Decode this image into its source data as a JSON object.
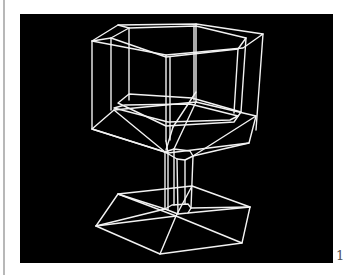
{
  "figure": {
    "background": "#000000",
    "line_color": "#f2f2f2",
    "line_width": 1.4,
    "page_number": "1",
    "polylines": [
      {
        "name": "rim-outer",
        "closed": true,
        "points": [
          [
            92,
            41
          ],
          [
            118,
            25
          ],
          [
            196,
            24
          ],
          [
            263,
            34
          ],
          [
            243,
            48
          ],
          [
            166,
            55
          ]
        ]
      },
      {
        "name": "rim-inner",
        "closed": true,
        "points": [
          [
            111,
            38
          ],
          [
            129,
            28
          ],
          [
            196,
            26
          ],
          [
            246,
            38
          ],
          [
            238,
            49
          ],
          [
            166,
            57
          ]
        ]
      },
      {
        "name": "rim-inner-link-a",
        "closed": false,
        "points": [
          [
            92,
            41
          ],
          [
            111,
            38
          ]
        ]
      },
      {
        "name": "rim-inner-link-b",
        "closed": false,
        "points": [
          [
            118,
            25
          ],
          [
            129,
            28
          ]
        ]
      },
      {
        "name": "wall-left-outer",
        "closed": false,
        "points": [
          [
            92,
            41
          ],
          [
            92,
            129
          ]
        ]
      },
      {
        "name": "wall-left-inner",
        "closed": false,
        "points": [
          [
            111,
            38
          ],
          [
            111,
            110
          ]
        ]
      },
      {
        "name": "wall-back-left",
        "closed": false,
        "points": [
          [
            129,
            28
          ],
          [
            129,
            100
          ]
        ]
      },
      {
        "name": "wall-back",
        "closed": false,
        "points": [
          [
            196,
            24
          ],
          [
            196,
            102
          ]
        ]
      },
      {
        "name": "wall-back-inner",
        "closed": false,
        "points": [
          [
            194,
            26
          ],
          [
            194,
            100
          ]
        ]
      },
      {
        "name": "wall-front-outer",
        "closed": false,
        "points": [
          [
            166,
            55
          ],
          [
            166,
            141
          ]
        ]
      },
      {
        "name": "wall-front-inner",
        "closed": false,
        "points": [
          [
            170,
            57
          ],
          [
            170,
            140
          ]
        ]
      },
      {
        "name": "wall-right-inner",
        "closed": false,
        "points": [
          [
            246,
            38
          ],
          [
            241,
            112
          ]
        ]
      },
      {
        "name": "wall-right-inner2",
        "closed": false,
        "points": [
          [
            238,
            49
          ],
          [
            234,
            113
          ]
        ]
      },
      {
        "name": "wall-right-outer",
        "closed": false,
        "points": [
          [
            263,
            34
          ],
          [
            256,
            130
          ]
        ]
      },
      {
        "name": "cup-floor-inner",
        "closed": true,
        "points": [
          [
            118,
            103
          ],
          [
            129,
            94
          ],
          [
            192,
            98
          ],
          [
            241,
            112
          ],
          [
            234,
            122
          ],
          [
            166,
            126
          ]
        ]
      },
      {
        "name": "cup-floor-inner2",
        "closed": true,
        "points": [
          [
            114,
            108
          ],
          [
            125,
            105
          ],
          [
            190,
            104
          ],
          [
            238,
            116
          ],
          [
            230,
            120
          ],
          [
            168,
            122
          ]
        ]
      },
      {
        "name": "bowl-bottom-outer",
        "closed": true,
        "points": [
          [
            92,
            129
          ],
          [
            114,
            110
          ],
          [
            196,
            102
          ],
          [
            256,
            116
          ],
          [
            249,
            143
          ],
          [
            168,
            153
          ]
        ]
      },
      {
        "name": "bowl-taper-1",
        "closed": false,
        "points": [
          [
            92,
            129
          ],
          [
            165,
            152
          ]
        ]
      },
      {
        "name": "bowl-taper-2",
        "closed": false,
        "points": [
          [
            114,
            110
          ],
          [
            165,
            152
          ]
        ]
      },
      {
        "name": "bowl-taper-3",
        "closed": false,
        "points": [
          [
            196,
            102
          ],
          [
            174,
            149
          ]
        ]
      },
      {
        "name": "bowl-taper-4",
        "closed": false,
        "points": [
          [
            256,
            116
          ],
          [
            193,
            156
          ]
        ]
      },
      {
        "name": "bowl-taper-5",
        "closed": false,
        "points": [
          [
            249,
            143
          ],
          [
            193,
            156
          ]
        ]
      },
      {
        "name": "bowl-taper-6",
        "closed": false,
        "points": [
          [
            166,
            141
          ],
          [
            168,
            153
          ]
        ]
      },
      {
        "name": "bowl-diagonal",
        "closed": false,
        "points": [
          [
            196,
            92
          ],
          [
            173,
            127
          ]
        ]
      },
      {
        "name": "bowl-diagonal-2",
        "closed": false,
        "points": [
          [
            173,
            127
          ],
          [
            166,
            150
          ]
        ]
      },
      {
        "name": "stem-top",
        "closed": true,
        "points": [
          [
            165,
            152
          ],
          [
            174,
            149
          ],
          [
            190,
            151
          ],
          [
            193,
            156
          ],
          [
            185,
            160
          ],
          [
            177,
            159
          ]
        ]
      },
      {
        "name": "stem-bottom",
        "closed": true,
        "points": [
          [
            165,
            209
          ],
          [
            172,
            205
          ],
          [
            188,
            204
          ],
          [
            191,
            208
          ],
          [
            188,
            213
          ],
          [
            178,
            214
          ]
        ]
      },
      {
        "name": "stem-edge-1",
        "closed": false,
        "points": [
          [
            165,
            152
          ],
          [
            165,
            209
          ]
        ]
      },
      {
        "name": "stem-edge-2",
        "closed": false,
        "points": [
          [
            168,
            153
          ],
          [
            168,
            210
          ]
        ]
      },
      {
        "name": "stem-edge-3",
        "closed": false,
        "points": [
          [
            174,
            149
          ],
          [
            174,
            205
          ]
        ]
      },
      {
        "name": "stem-edge-4",
        "closed": false,
        "points": [
          [
            177,
            159
          ],
          [
            178,
            214
          ]
        ]
      },
      {
        "name": "stem-edge-5",
        "closed": false,
        "points": [
          [
            185,
            160
          ],
          [
            185,
            204
          ]
        ]
      },
      {
        "name": "stem-edge-6",
        "closed": false,
        "points": [
          [
            193,
            156
          ],
          [
            191,
            208
          ]
        ]
      },
      {
        "name": "base-outer",
        "closed": true,
        "points": [
          [
            96,
            226
          ],
          [
            118,
            194
          ],
          [
            192,
            186
          ],
          [
            250,
            207
          ],
          [
            242,
            243
          ],
          [
            160,
            254
          ]
        ]
      },
      {
        "name": "base-spoke-1",
        "closed": false,
        "points": [
          [
            96,
            226
          ],
          [
            165,
            209
          ]
        ]
      },
      {
        "name": "base-spoke-2",
        "closed": false,
        "points": [
          [
            118,
            194
          ],
          [
            176,
            216
          ]
        ]
      },
      {
        "name": "base-spoke-3",
        "closed": false,
        "points": [
          [
            192,
            186
          ],
          [
            176,
            216
          ]
        ]
      },
      {
        "name": "base-spoke-4",
        "closed": false,
        "points": [
          [
            250,
            207
          ],
          [
            188,
            213
          ]
        ]
      },
      {
        "name": "base-spoke-5",
        "closed": false,
        "points": [
          [
            242,
            243
          ],
          [
            176,
            216
          ]
        ]
      },
      {
        "name": "base-spoke-6",
        "closed": false,
        "points": [
          [
            160,
            254
          ],
          [
            176,
            216
          ]
        ]
      },
      {
        "name": "base-spoke-7",
        "closed": false,
        "points": [
          [
            96,
            226
          ],
          [
            176,
            216
          ]
        ]
      },
      {
        "name": "base-spoke-8",
        "closed": false,
        "points": [
          [
            118,
            194
          ],
          [
            165,
            209
          ]
        ]
      },
      {
        "name": "base-spoke-9",
        "closed": false,
        "points": [
          [
            250,
            207
          ],
          [
            191,
            208
          ]
        ]
      }
    ]
  }
}
